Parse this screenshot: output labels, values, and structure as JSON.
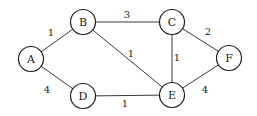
{
  "diagram": {
    "type": "weighted-undirected-graph",
    "nodes": [
      {
        "id": "A",
        "label": "A"
      },
      {
        "id": "B",
        "label": "B"
      },
      {
        "id": "C",
        "label": "C"
      },
      {
        "id": "D",
        "label": "D"
      },
      {
        "id": "E",
        "label": "E"
      },
      {
        "id": "F",
        "label": "F"
      }
    ],
    "edges": [
      {
        "from": "A",
        "to": "B",
        "weight": "1"
      },
      {
        "from": "A",
        "to": "D",
        "weight": "4"
      },
      {
        "from": "B",
        "to": "C",
        "weight": "3"
      },
      {
        "from": "B",
        "to": "E",
        "weight": "1"
      },
      {
        "from": "D",
        "to": "E",
        "weight": "1"
      },
      {
        "from": "C",
        "to": "E",
        "weight": "1"
      },
      {
        "from": "C",
        "to": "F",
        "weight": "2"
      },
      {
        "from": "E",
        "to": "F",
        "weight": "4"
      }
    ]
  }
}
